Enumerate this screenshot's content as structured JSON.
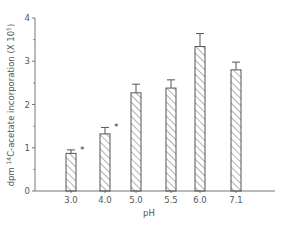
{
  "chart_data": {
    "type": "bar",
    "title": "",
    "xlabel": "pH",
    "ylabel": "dpm 14C-acetate incorporation (X 10^5)",
    "ylabel_parts": {
      "prefix": "dpm ",
      "superscript": "14",
      "main": "C-acetate incorporation (X 10",
      "exp": "5",
      "suffix": ")"
    },
    "categories": [
      "3.0",
      "4.0",
      "5.0",
      "5.5",
      "6.0",
      "7.1"
    ],
    "values": [
      0.87,
      1.32,
      2.27,
      2.38,
      3.34,
      2.8
    ],
    "error_upper": [
      0.95,
      1.47,
      2.47,
      2.57,
      3.64,
      2.98
    ],
    "significance_markers": [
      "*",
      "*",
      "",
      "",
      "",
      ""
    ],
    "ylim": [
      0,
      4
    ],
    "yticks": [
      "0",
      "1",
      "2",
      "3",
      "4"
    ],
    "grid": false,
    "bar_fill": "diagonal-hatch",
    "colors": {
      "axis": "#777777",
      "bar_stroke": "#555555",
      "hatch": "#666666"
    }
  }
}
